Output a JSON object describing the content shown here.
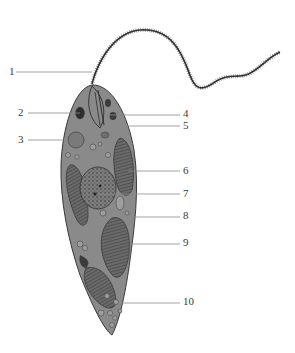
{
  "diagram": {
    "colors": {
      "body_fill": "#8a8a8a",
      "body_stroke": "#3a3a3a",
      "organelle_dark": "#3c3c3c",
      "organelle_mid": "#6e6e6e",
      "vacuole_fill": "#9e9e9e",
      "leader_line": "#8c8c8c",
      "label_text": "#3a3a3a"
    },
    "labels": [
      {
        "id": "1",
        "text": "1",
        "x": 9,
        "y": 66,
        "line": [
          16,
          72,
          92,
          72
        ]
      },
      {
        "id": "2",
        "text": "2",
        "x": 18,
        "y": 107,
        "line": [
          28,
          113,
          80,
          113
        ]
      },
      {
        "id": "3",
        "text": "3",
        "x": 18,
        "y": 134,
        "line": [
          28,
          140,
          68,
          140
        ]
      },
      {
        "id": "4",
        "text": "4",
        "x": 183,
        "y": 108,
        "line": [
          104,
          115,
          180,
          115
        ]
      },
      {
        "id": "5",
        "text": "5",
        "x": 183,
        "y": 120,
        "line": [
          102,
          126,
          180,
          126
        ]
      },
      {
        "id": "6",
        "text": "6",
        "x": 183,
        "y": 165,
        "line": [
          128,
          171,
          180,
          171
        ]
      },
      {
        "id": "7",
        "text": "7",
        "x": 183,
        "y": 188,
        "line": [
          98,
          194,
          180,
          194
        ]
      },
      {
        "id": "8",
        "text": "8",
        "x": 183,
        "y": 210,
        "line": [
          130,
          217,
          180,
          217
        ]
      },
      {
        "id": "9",
        "text": "9",
        "x": 183,
        "y": 237,
        "line": [
          130,
          244,
          180,
          244
        ]
      },
      {
        "id": "10",
        "text": "10",
        "x": 183,
        "y": 296,
        "line": [
          118,
          303,
          180,
          303
        ]
      }
    ]
  }
}
